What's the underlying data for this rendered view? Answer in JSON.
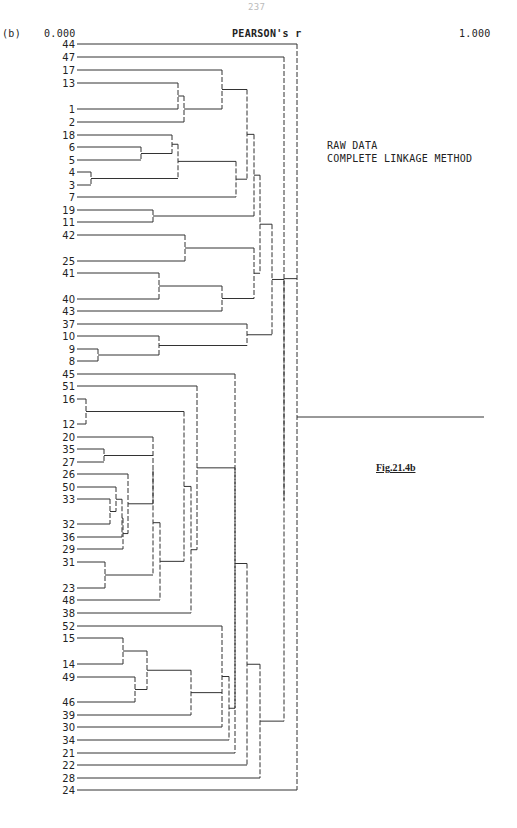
{
  "page": {
    "number": "237"
  },
  "panel_label": "(b)",
  "notes": [
    "RAW DATA",
    "COMPLETE LINKAGE METHOD"
  ],
  "figure_label": "Fig.21.4b",
  "chart_data": {
    "type": "dendrogram",
    "title": "PEARSON's r",
    "xlabel": "PEARSON's r",
    "axis_min_label": "0.000",
    "axis_max_label": "1.000",
    "xlim": [
      0.0,
      1.0
    ],
    "method": "Complete linkage",
    "data": "Raw data",
    "leaf_order": [
      "44",
      "47",
      "17",
      "13",
      "1",
      "2",
      "18",
      "6",
      "5",
      "4",
      "3",
      "7",
      "19",
      "11",
      "42",
      "25",
      "41",
      "40",
      "43",
      "37",
      "10",
      "9",
      "8",
      "45",
      "51",
      "16",
      "12",
      "20",
      "35",
      "27",
      "26",
      "50",
      "33",
      "32",
      "36",
      "29",
      "31",
      "23",
      "48",
      "38",
      "52",
      "15",
      "14",
      "49",
      "46",
      "39",
      "30",
      "34",
      "21",
      "22",
      "28",
      "24"
    ],
    "leaf_y": {
      "44": 44,
      "47": 57,
      "17": 70,
      "13": 83,
      "1": 109,
      "2": 122,
      "18": 135,
      "6": 147,
      "5": 160,
      "4": 172,
      "3": 185,
      "7": 197,
      "19": 210,
      "11": 222,
      "42": 235,
      "25": 261,
      "41": 273,
      "40": 299,
      "43": 311,
      "37": 324,
      "10": 336,
      "9": 349,
      "8": 361,
      "45": 374,
      "51": 386,
      "16": 399,
      "12": 424,
      "20": 437,
      "35": 449,
      "27": 462,
      "26": 474,
      "50": 487,
      "33": 499,
      "32": 524,
      "36": 537,
      "29": 549,
      "31": 562,
      "23": 588,
      "48": 600,
      "38": 613,
      "52": 626,
      "15": 638,
      "14": 664,
      "49": 677,
      "46": 702,
      "39": 715,
      "30": 727,
      "34": 740,
      "21": 753,
      "22": 765,
      "28": 778,
      "24": 790
    },
    "merges": [
      {
        "id": "a1",
        "children": [
          "13",
          "1"
        ],
        "x": 178
      },
      {
        "id": "a2",
        "children": [
          "a1",
          "2"
        ],
        "x": 184
      },
      {
        "id": "a3",
        "children": [
          "17",
          "a2"
        ],
        "x": 222
      },
      {
        "id": "b1",
        "children": [
          "4",
          "3"
        ],
        "x": 91
      },
      {
        "id": "b2",
        "children": [
          "6",
          "5"
        ],
        "x": 141
      },
      {
        "id": "b3",
        "children": [
          "18",
          "b2"
        ],
        "x": 172
      },
      {
        "id": "b4",
        "children": [
          "b3",
          "b1"
        ],
        "x": 178
      },
      {
        "id": "b5",
        "children": [
          "b4",
          "7"
        ],
        "x": 236
      },
      {
        "id": "c1",
        "children": [
          "a3",
          "b5"
        ],
        "x": 247
      },
      {
        "id": "d1",
        "children": [
          "19",
          "11"
        ],
        "x": 153
      },
      {
        "id": "d2",
        "children": [
          "c1",
          "d1"
        ],
        "x": 254
      },
      {
        "id": "e1",
        "children": [
          "42",
          "25"
        ],
        "x": 185
      },
      {
        "id": "e2",
        "children": [
          "41",
          "40"
        ],
        "x": 159
      },
      {
        "id": "e3",
        "children": [
          "e2",
          "43"
        ],
        "x": 222
      },
      {
        "id": "e4",
        "children": [
          "e1",
          "e3"
        ],
        "x": 254
      },
      {
        "id": "f1",
        "children": [
          "d2",
          "e4"
        ],
        "x": 260
      },
      {
        "id": "g1",
        "children": [
          "9",
          "8"
        ],
        "x": 98
      },
      {
        "id": "g2",
        "children": [
          "10",
          "g1"
        ],
        "x": 159
      },
      {
        "id": "g3",
        "children": [
          "37",
          "g2"
        ],
        "x": 247
      },
      {
        "id": "h1",
        "children": [
          "f1",
          "g3"
        ],
        "x": 272
      },
      {
        "id": "i1",
        "children": [
          "16",
          "12"
        ],
        "x": 86
      },
      {
        "id": "j1",
        "children": [
          "35",
          "27"
        ],
        "x": 104
      },
      {
        "id": "j2",
        "children": [
          "33",
          "32"
        ],
        "x": 110
      },
      {
        "id": "j3",
        "children": [
          "50",
          "j2"
        ],
        "x": 116
      },
      {
        "id": "j4",
        "children": [
          "j3",
          "36"
        ],
        "x": 122
      },
      {
        "id": "j5",
        "children": [
          "j4",
          "29"
        ],
        "x": 123
      },
      {
        "id": "j6",
        "children": [
          "26",
          "j5"
        ],
        "x": 128
      },
      {
        "id": "j7",
        "children": [
          "20",
          "j1",
          "j6"
        ],
        "x": 153
      },
      {
        "id": "j8",
        "children": [
          "31",
          "23"
        ],
        "x": 105
      },
      {
        "id": "j9",
        "children": [
          "j7",
          "j8"
        ],
        "x": 153
      },
      {
        "id": "j10",
        "children": [
          "j9",
          "48"
        ],
        "x": 160
      },
      {
        "id": "k1",
        "children": [
          "i1",
          "j10"
        ],
        "x": 184
      },
      {
        "id": "k2",
        "children": [
          "k1",
          "38"
        ],
        "x": 191
      },
      {
        "id": "k3",
        "children": [
          "51",
          "k2"
        ],
        "x": 197
      },
      {
        "id": "l1",
        "children": [
          "15",
          "14"
        ],
        "x": 123
      },
      {
        "id": "l2",
        "children": [
          "49",
          "46"
        ],
        "x": 135
      },
      {
        "id": "l3",
        "children": [
          "l1",
          "l2"
        ],
        "x": 147
      },
      {
        "id": "l4",
        "children": [
          "l3",
          "39"
        ],
        "x": 191
      },
      {
        "id": "l5",
        "children": [
          "52",
          "l4",
          "30"
        ],
        "x": 222
      },
      {
        "id": "l6",
        "children": [
          "l5",
          "34"
        ],
        "x": 229
      },
      {
        "id": "m1",
        "children": [
          "k3",
          "l6"
        ],
        "x": 235
      },
      {
        "id": "m2",
        "children": [
          "45",
          "m1",
          "21"
        ],
        "x": 235
      },
      {
        "id": "m3",
        "children": [
          "m2",
          "22"
        ],
        "x": 247
      },
      {
        "id": "m4",
        "children": [
          "m3",
          "28"
        ],
        "x": 260
      },
      {
        "id": "n1",
        "children": [
          "h1",
          "m4"
        ],
        "x": 284
      },
      {
        "id": "o1",
        "children": [
          "47",
          "n1"
        ],
        "x": 284
      },
      {
        "id": "root",
        "children": [
          "44",
          "o1",
          "24"
        ],
        "x": 297
      }
    ],
    "root_line_end_x": 484,
    "leaf_line_start_x": 77,
    "grid": false
  }
}
